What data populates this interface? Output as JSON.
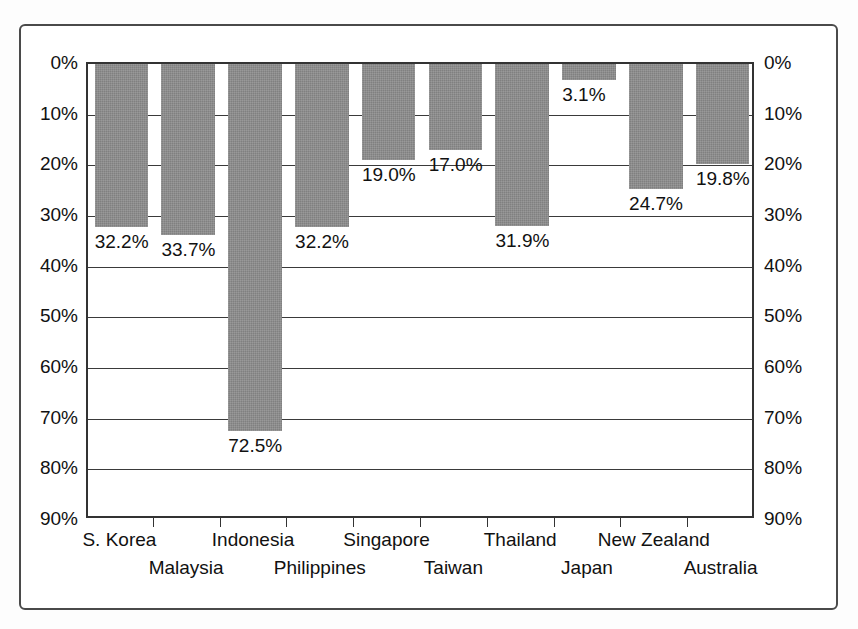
{
  "chart_data": {
    "type": "bar",
    "title": "",
    "subtitle": "",
    "xlabel": "",
    "ylabel": "",
    "categories": [
      "S. Korea",
      "Malaysia",
      "Indonesia",
      "Philippines",
      "Singapore",
      "Taiwan",
      "Thailand",
      "Japan",
      "New Zealand",
      "Australia"
    ],
    "values": [
      32.2,
      33.7,
      72.5,
      32.2,
      19.0,
      17.0,
      31.9,
      3.1,
      24.7,
      19.8
    ],
    "value_labels": [
      "32.2%",
      "33.7%",
      "72.5%",
      "32.2%",
      "19.0%",
      "17.0%",
      "31.9%",
      "3.1%",
      "24.7%",
      "19.8%"
    ],
    "ylim": [
      0,
      90
    ],
    "y_inverted": true,
    "y_ticks": [
      0,
      10,
      20,
      30,
      40,
      50,
      60,
      70,
      80,
      90
    ],
    "y_tick_labels": [
      "0%",
      "10%",
      "20%",
      "30%",
      "40%",
      "50%",
      "60%",
      "70%",
      "80%",
      "90%"
    ],
    "y_axis_left_labels": [
      "0%",
      "10%",
      "20%",
      "30%",
      "40%",
      "50%",
      "60%",
      "70%",
      "80%",
      "90%"
    ],
    "y_axis_right_labels": [
      "0%",
      "10%",
      "20%",
      "30%",
      "40%",
      "50%",
      "60%",
      "70%",
      "80%",
      "90%"
    ],
    "grid": true,
    "grid_axis": "y",
    "legend": false,
    "legend_position": "none",
    "bar_color": "#808080",
    "bar_edge_color": "#808080",
    "axis_color": "#333333",
    "gridline_color": "#3a3a3a",
    "background_color": "#ffffff",
    "text_color": "#111111",
    "label_stagger_rows": 2,
    "series": [
      {
        "name": "",
        "values": [
          32.2,
          33.7,
          72.5,
          32.2,
          19.0,
          17.0,
          31.9,
          3.1,
          24.7,
          19.8
        ]
      }
    ]
  }
}
